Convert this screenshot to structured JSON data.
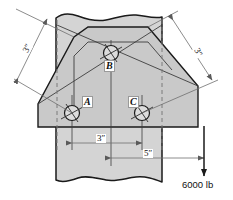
{
  "figure": {
    "type": "engineering-mechanics-diagram",
    "colors": {
      "plate_fill": "#c9c9c9",
      "column_fill": "#d4d4d4",
      "outline": "#1a1a1a",
      "thin_line": "#4d4d4d",
      "dimension_line": "#6e6e6e",
      "hidden_line": "#7a7a7a",
      "label_text": "#111111",
      "background": "#ffffff"
    }
  },
  "bolts": [
    {
      "id": "A",
      "label": "A",
      "cx": 72,
      "cy": 113,
      "r": 7.5,
      "label_x": 82,
      "label_y": 101
    },
    {
      "id": "B",
      "label": "B",
      "cx": 111,
      "cy": 53,
      "r": 7.5,
      "label_x": 104,
      "label_y": 63
    },
    {
      "id": "C",
      "label": "C",
      "cx": 142,
      "cy": 113,
      "r": 7.5,
      "label_x": 130,
      "label_y": 101
    }
  ],
  "dimensions": [
    {
      "id": "dim-left-3in",
      "label": "3″",
      "orientation": "diagonal-left",
      "label_x": 27,
      "label_y": 48
    },
    {
      "id": "dim-right-3in",
      "label": "3″",
      "orientation": "diagonal-right",
      "label_x": 197,
      "label_y": 52
    },
    {
      "id": "dim-bottom-3in",
      "label": "3″",
      "orientation": "horizontal",
      "label_x": 99,
      "label_y": 143
    },
    {
      "id": "dim-bottom-5in",
      "label": "5″",
      "orientation": "horizontal",
      "label_x": 145,
      "label_y": 158
    }
  ],
  "load": {
    "label": "6000 lb",
    "value": 6000,
    "unit": "lb",
    "direction": "down",
    "label_x": 190,
    "label_y": 184,
    "arrow_x": 204,
    "arrow_top_y": 126,
    "arrow_tip_y": 176
  }
}
